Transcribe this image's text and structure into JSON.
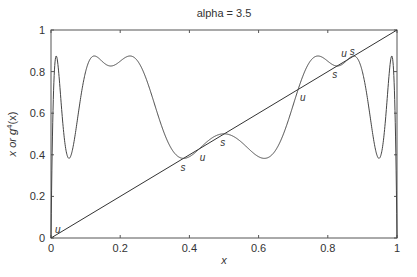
{
  "chart_data": {
    "type": "line",
    "title": "alpha = 3.5",
    "xlabel": "x",
    "ylabel": "x or g⁴(x)",
    "xlim": [
      0,
      1
    ],
    "ylim": [
      0,
      1
    ],
    "grid": false,
    "legend": null,
    "x_ticks": [
      "0",
      "0.2",
      "0.4",
      "0.6",
      "0.8",
      "1"
    ],
    "y_ticks": [
      "0",
      "0.2",
      "0.4",
      "0.6",
      "0.8",
      "1"
    ],
    "parameters": {
      "alpha": 3.5
    },
    "series": [
      {
        "name": "x",
        "description": "identity line y = x",
        "points": [
          [
            0,
            0
          ],
          [
            1,
            1
          ]
        ]
      },
      {
        "name": "g^4(x)",
        "description": "fourth iterate of logistic map g(x) = alpha*x*(1-x)",
        "function": "g4"
      }
    ],
    "annotations": [
      {
        "text": "u",
        "x": 0.0,
        "y": 0.0,
        "meaning": "unstable fixed point"
      },
      {
        "text": "s",
        "x": 0.383,
        "y": 0.383,
        "meaning": "stable fixed point"
      },
      {
        "text": "u",
        "x": 0.43,
        "y": 0.43,
        "meaning": "unstable fixed point"
      },
      {
        "text": "s",
        "x": 0.501,
        "y": 0.501,
        "meaning": "stable fixed point"
      },
      {
        "text": "u",
        "x": 0.714,
        "y": 0.714,
        "meaning": "unstable fixed point"
      },
      {
        "text": "s",
        "x": 0.827,
        "y": 0.827,
        "meaning": "stable fixed point"
      },
      {
        "text": "u",
        "x": 0.845,
        "y": 0.845,
        "meaning": "unstable fixed point"
      },
      {
        "text": "s",
        "x": 0.875,
        "y": 0.875,
        "meaning": "stable fixed point"
      }
    ]
  },
  "labels": {
    "title": "alpha = 3.5",
    "xlabel": "x",
    "ylabel_prefix": "x or g",
    "ylabel_sup": "4",
    "ylabel_suffix": "(x)"
  }
}
